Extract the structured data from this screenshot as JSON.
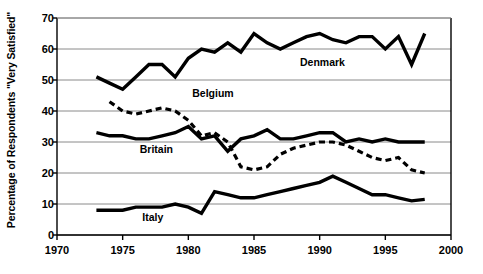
{
  "chart_data": {
    "type": "line",
    "title": "",
    "xlabel": "",
    "ylabel": "Percentage of Respondents \"Very Satisfied\"",
    "xlim": [
      1970,
      2000
    ],
    "ylim": [
      0,
      70
    ],
    "xticks": [
      1970,
      1975,
      1980,
      1985,
      1990,
      1995,
      2000
    ],
    "yticks": [
      0,
      10,
      20,
      30,
      40,
      50,
      60,
      70
    ],
    "grid": true,
    "legend_position": "inline-annotations",
    "series": [
      {
        "name": "Denmark",
        "style": "solid",
        "color": "#000000",
        "label_x": 1988.5,
        "label_y": 55.5,
        "x": [
          1973,
          1974,
          1975,
          1976,
          1977,
          1978,
          1979,
          1980,
          1981,
          1982,
          1983,
          1984,
          1985,
          1986,
          1987,
          1988,
          1989,
          1990,
          1991,
          1992,
          1993,
          1994,
          1995,
          1996,
          1997,
          1998
        ],
        "y": [
          51,
          49,
          47,
          51,
          55,
          55,
          51,
          57,
          60,
          59,
          62,
          59,
          65,
          62,
          60,
          62,
          64,
          65,
          63,
          62,
          64,
          64,
          60,
          64,
          55,
          65
        ]
      },
      {
        "name": "Belgium",
        "style": "dashed",
        "color": "#000000",
        "label_x": 1980.3,
        "label_y": 45.5,
        "x": [
          1974,
          1975,
          1976,
          1977,
          1978,
          1979,
          1980,
          1981,
          1982,
          1983,
          1984,
          1985,
          1986,
          1987,
          1988,
          1989,
          1990,
          1991,
          1992,
          1993,
          1994,
          1995,
          1996,
          1997,
          1998
        ],
        "y": [
          43,
          40,
          39,
          40,
          41,
          40,
          37,
          32,
          33,
          30,
          22,
          21,
          22,
          26,
          28,
          29,
          30,
          30,
          29,
          27,
          25,
          24,
          25,
          21,
          20
        ]
      },
      {
        "name": "Britain",
        "style": "solid",
        "color": "#000000",
        "label_x": 1976.3,
        "label_y": 27.5,
        "x": [
          1973,
          1974,
          1975,
          1976,
          1977,
          1978,
          1979,
          1980,
          1981,
          1982,
          1983,
          1984,
          1985,
          1986,
          1987,
          1988,
          1989,
          1990,
          1991,
          1992,
          1993,
          1994,
          1995,
          1996,
          1997,
          1998
        ],
        "y": [
          33,
          32,
          32,
          31,
          31,
          32,
          33,
          35,
          31,
          32,
          27,
          31,
          32,
          34,
          31,
          31,
          32,
          33,
          33,
          30,
          31,
          30,
          31,
          30,
          30,
          30
        ]
      },
      {
        "name": "Italy",
        "style": "solid",
        "color": "#000000",
        "label_x": 1976.5,
        "label_y": 5.5,
        "x": [
          1973,
          1974,
          1975,
          1976,
          1977,
          1978,
          1979,
          1980,
          1981,
          1982,
          1983,
          1984,
          1985,
          1986,
          1987,
          1988,
          1989,
          1990,
          1991,
          1992,
          1993,
          1994,
          1995,
          1996,
          1997,
          1998
        ],
        "y": [
          8,
          8,
          8,
          9,
          9,
          9,
          10,
          9,
          7,
          14,
          13,
          12,
          12,
          13,
          14,
          15,
          16,
          17,
          19,
          17,
          15,
          13,
          13,
          12,
          11,
          11.5
        ]
      }
    ]
  }
}
